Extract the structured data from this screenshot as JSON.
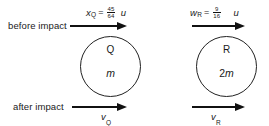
{
  "diagram": {
    "type": "physics-collision-diagram",
    "background_color": "#ffffff",
    "line_color": "#111111"
  },
  "rows": {
    "before_label": "before impact",
    "after_label": "after impact"
  },
  "bodies": [
    {
      "name": "Q",
      "mass": "m",
      "mass_coefficient": "",
      "before_velocity": {
        "symbol": "x",
        "subscript": "Q",
        "equals": "=",
        "numerator": "45",
        "denominator": "64",
        "unit": "u"
      },
      "after_velocity": {
        "symbol": "v",
        "subscript": "Q"
      }
    },
    {
      "name": "R",
      "mass": "m",
      "mass_coefficient": "2",
      "before_velocity": {
        "symbol": "w",
        "subscript": "R",
        "equals": "=",
        "numerator": "9",
        "denominator": "16",
        "unit": "u"
      },
      "after_velocity": {
        "symbol": "v",
        "subscript": "R"
      }
    }
  ]
}
